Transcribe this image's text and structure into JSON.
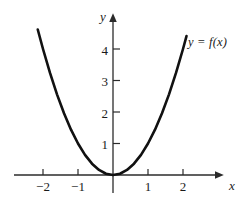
{
  "figure": {
    "background_color": "#ffffff",
    "curve_color": "#111111",
    "axis_color": "#2b2b2b",
    "text_color": "#1a1a1a"
  },
  "labels": {
    "x_axis_name": "x",
    "y_axis_name": "y",
    "curve_label": "y = f(x)"
  },
  "chart_data": {
    "type": "line",
    "title": "",
    "xlabel": "x",
    "ylabel": "y",
    "grid": false,
    "legend_position": "none",
    "annotations": [
      {
        "text": "y = f(x)",
        "x": 2.4,
        "y": 4.4,
        "style": "italic"
      }
    ],
    "xlim": [
      -2.6,
      3.1
    ],
    "ylim": [
      -0.35,
      5.1
    ],
    "xticks": [
      -2,
      -1,
      1,
      2
    ],
    "xtick_labels": [
      "−2",
      "−1",
      "1",
      "2"
    ],
    "yticks": [
      1,
      2,
      3,
      4
    ],
    "ytick_labels": [
      "1",
      "2",
      "3",
      "4"
    ],
    "series": [
      {
        "name": "f(x) = x²",
        "x": [
          -2.15,
          -2.0,
          -1.8,
          -1.6,
          -1.4,
          -1.2,
          -1.0,
          -0.8,
          -0.6,
          -0.4,
          -0.2,
          0.0,
          0.2,
          0.4,
          0.6,
          0.8,
          1.0,
          1.2,
          1.4,
          1.6,
          1.8,
          2.0,
          2.1
        ],
        "values": [
          4.62,
          4.0,
          3.24,
          2.56,
          1.96,
          1.44,
          1.0,
          0.64,
          0.36,
          0.16,
          0.04,
          0.0,
          0.04,
          0.16,
          0.36,
          0.64,
          1.0,
          1.44,
          1.96,
          2.56,
          3.24,
          4.0,
          4.41
        ]
      }
    ]
  },
  "geometry": {
    "origin_x": 113,
    "origin_y": 175,
    "x_unit_px": 35,
    "y_unit_px": 31.5
  }
}
